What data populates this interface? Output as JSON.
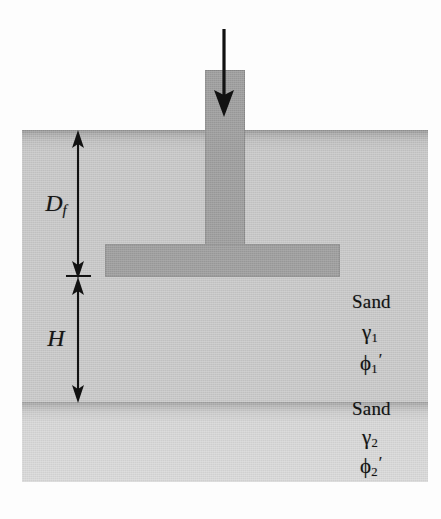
{
  "figure": {
    "width": 441,
    "height": 519
  },
  "colors": {
    "soil_upper": "#c6c6c6",
    "soil_lower": "#d7d7d7",
    "soil_upper_surface_band": "#8f8f8f",
    "soil_lower_surface_band": "#9d9d9d",
    "concrete": "#9b9b9b",
    "ink": "#131313",
    "background": "#fdfdfd"
  },
  "load": {
    "arrow_name": "downward-load-arrow",
    "direction": "down"
  },
  "dimensions": [
    {
      "key": "Df",
      "label_main": "D",
      "label_sub": "f",
      "name": "depth-of-foundation",
      "arrow_style": "double-headed-vertical",
      "from_y": 132,
      "to_y": 275
    },
    {
      "key": "H",
      "label_main": "H",
      "label_sub": "",
      "name": "thickness-of-upper-sand-below-footing",
      "arrow_style": "double-headed-vertical",
      "from_y": 278,
      "to_y": 401
    }
  ],
  "layers": [
    {
      "id": "upper",
      "name": "Sand",
      "unit_weight_symbol": "γ",
      "unit_weight_subscript": "1",
      "friction_angle_symbol": "ϕ",
      "friction_angle_subscript": "1",
      "friction_angle_prime": "′",
      "top_y": 130,
      "bottom_y": 402
    },
    {
      "id": "lower",
      "name": "Sand",
      "unit_weight_symbol": "γ",
      "unit_weight_subscript": "2",
      "friction_angle_symbol": "ϕ",
      "friction_angle_subscript": "2",
      "friction_angle_prime": "′",
      "top_y": 402,
      "bottom_y": 482
    }
  ],
  "foundation": {
    "stem_name": "foundation-column-stem",
    "base_name": "foundation-footing-base",
    "stem": {
      "x": 205,
      "y": 70,
      "w": 40,
      "h": 178
    },
    "base": {
      "x": 105,
      "y": 244,
      "w": 235,
      "h": 33
    }
  }
}
